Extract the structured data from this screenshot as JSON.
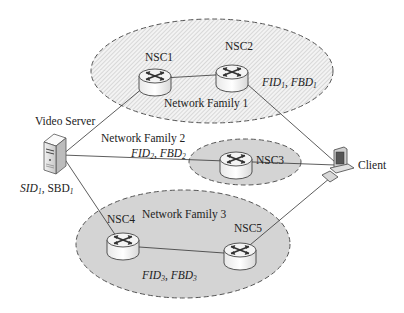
{
  "figure": {
    "families": [
      {
        "id": "nf1",
        "label": "Network Family 1",
        "params": {
          "fid": "FID",
          "fbd": "FBD",
          "sub": "1"
        },
        "fill": "hatched"
      },
      {
        "id": "nf2",
        "label": "Network Family 2",
        "params": {
          "fid": "FID",
          "fbd": "FBD",
          "sub": "2"
        },
        "fill": "#d4d4d4"
      },
      {
        "id": "nf3",
        "label": "Network Family 3",
        "params": {
          "fid": "FID",
          "fbd": "FBD",
          "sub": "3"
        },
        "fill": "#d4d4d4"
      }
    ],
    "nodes": {
      "nsc1": {
        "label": "NSC1",
        "type": "router"
      },
      "nsc2": {
        "label": "NSC2",
        "type": "router"
      },
      "nsc3": {
        "label": "NSC3",
        "type": "router"
      },
      "nsc4": {
        "label": "NSC4",
        "type": "router"
      },
      "nsc5": {
        "label": "NSC5",
        "type": "router"
      },
      "server": {
        "label": "Video Server",
        "type": "server-icon",
        "params": {
          "sid": "SID",
          "sbd": "SBD",
          "sub": "1"
        }
      },
      "client": {
        "label": "Client",
        "type": "computer-icon"
      }
    },
    "edges": [
      [
        "server",
        "nsc1"
      ],
      [
        "nsc1",
        "nsc2"
      ],
      [
        "nsc2",
        "client"
      ],
      [
        "server",
        "nsc3"
      ],
      [
        "nsc3",
        "client"
      ],
      [
        "server",
        "nsc4"
      ],
      [
        "nsc4",
        "nsc5"
      ],
      [
        "nsc5",
        "client"
      ]
    ],
    "colors": {
      "dash": "#555555",
      "shade": "#d4d4d4",
      "hatch": "#bdbdbd",
      "line": "#333333"
    }
  }
}
